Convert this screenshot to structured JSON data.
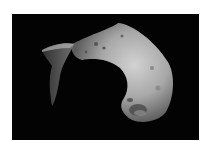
{
  "image": {
    "subject": "asteroid",
    "background_color": "#ffffff",
    "space_color": "#030303",
    "surface_light": "#c8c8c8",
    "surface_shadow": "#5a5a5a"
  }
}
